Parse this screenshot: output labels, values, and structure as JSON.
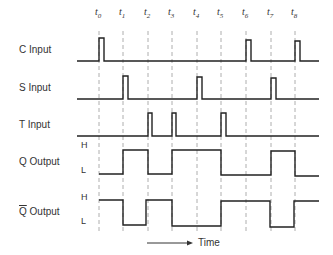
{
  "diagram": {
    "type": "timing-diagram",
    "time_markers": [
      "t0",
      "t1",
      "t2",
      "t3",
      "t4",
      "t5",
      "t6",
      "t7",
      "t8"
    ],
    "time_marker_x": [
      99,
      123,
      148,
      172,
      197,
      221,
      246,
      271,
      295
    ],
    "signals": [
      {
        "id": "c",
        "label": "C Input",
        "pulses_at": [
          "t0",
          "t6",
          "t8"
        ]
      },
      {
        "id": "s",
        "label": "S Input",
        "pulses_at": [
          "t1",
          "t4",
          "t7"
        ]
      },
      {
        "id": "t",
        "label": "T Input",
        "pulses_at": [
          "t2",
          "t3",
          "t5"
        ]
      },
      {
        "id": "q",
        "label": "Q Output",
        "levels": [
          "L",
          "H",
          "L",
          "H",
          "H",
          "L",
          "L",
          "H",
          "L"
        ],
        "high_label": "H",
        "low_label": "L"
      },
      {
        "id": "qbar",
        "label_bar": "Q",
        "label_rest": " Output",
        "levels": [
          "H",
          "L",
          "H",
          "L",
          "L",
          "H",
          "H",
          "L",
          "H"
        ],
        "high_label": "H",
        "low_label": "L"
      }
    ],
    "time_axis_label": "Time",
    "colors": {
      "line": "#222222",
      "grid": "#999999",
      "text": "#333333"
    }
  }
}
